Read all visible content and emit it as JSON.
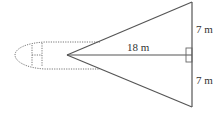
{
  "diagram": {
    "labels": {
      "center_length": "18 m",
      "upper_half": "7 m",
      "lower_half": "7 m"
    },
    "colors": {
      "line": "#555555",
      "dotted": "#777777",
      "text": "#333333"
    }
  }
}
